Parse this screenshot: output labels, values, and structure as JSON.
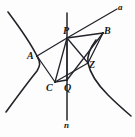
{
  "figure": {
    "stroke_color": "#22242a",
    "background_color": "#fdfdfd",
    "line_width_curve": 1.6,
    "line_width_segment": 1.3,
    "line_width_axis": 1.5
  },
  "labels": [
    {
      "id": "a",
      "text": "a",
      "x": 118,
      "y": 3,
      "size": "small"
    },
    {
      "id": "B",
      "text": "B",
      "x": 104,
      "y": 26,
      "size": "normal"
    },
    {
      "id": "P",
      "text": "P",
      "x": 63,
      "y": 26,
      "size": "normal"
    },
    {
      "id": "A",
      "text": "A",
      "x": 27,
      "y": 51,
      "size": "normal"
    },
    {
      "id": "Z",
      "text": "Z",
      "x": 89,
      "y": 60,
      "size": "normal"
    },
    {
      "id": "C",
      "text": "C",
      "x": 46,
      "y": 83,
      "size": "normal"
    },
    {
      "id": "Q",
      "text": "Q",
      "x": 64,
      "y": 83,
      "size": "normal"
    },
    {
      "id": "n",
      "text": "n",
      "x": 64,
      "y": 121,
      "size": "small"
    }
  ],
  "points": {
    "A": {
      "x": 37,
      "y": 56
    },
    "B": {
      "x": 103,
      "y": 33
    },
    "C": {
      "x": 55,
      "y": 82
    },
    "P": {
      "x": 67,
      "y": 38
    },
    "Q": {
      "x": 67,
      "y": 80
    },
    "Z": {
      "x": 88,
      "y": 63
    }
  },
  "curves": {
    "left_branch": "M 8,12 C 20,28 30,42 37,56 C 41,63 40,66 37,71 C 28,82 17,97 6,112",
    "right_branch": "M 96,40 C 90,48 87,56 88,63 C 90,73 98,85 108,95 C 116,103 124,110 131,116"
  },
  "lines": {
    "n_axis": {
      "x1": 67,
      "y1": 13,
      "x2": 67,
      "y2": 120
    },
    "a_ray": {
      "x1": 67,
      "y1": 38,
      "x2": 117,
      "y2": 9
    },
    "segments": [
      {
        "name": "A-P",
        "x1": 37,
        "y1": 56,
        "x2": 67,
        "y2": 38
      },
      {
        "name": "P-B",
        "x1": 67,
        "y1": 38,
        "x2": 103,
        "y2": 33
      },
      {
        "name": "A-C",
        "x1": 37,
        "y1": 56,
        "x2": 55,
        "y2": 82
      },
      {
        "name": "C-Q",
        "x1": 55,
        "y1": 82,
        "x2": 67,
        "y2": 80
      },
      {
        "name": "P-C",
        "x1": 67,
        "y1": 38,
        "x2": 55,
        "y2": 82
      },
      {
        "name": "P-Q",
        "x1": 67,
        "y1": 38,
        "x2": 67,
        "y2": 80
      },
      {
        "name": "P-Z",
        "x1": 67,
        "y1": 38,
        "x2": 88,
        "y2": 63
      },
      {
        "name": "B-Q",
        "x1": 103,
        "y1": 33,
        "x2": 67,
        "y2": 80
      },
      {
        "name": "B-Z",
        "x1": 103,
        "y1": 33,
        "x2": 88,
        "y2": 63
      },
      {
        "name": "Z-C",
        "x1": 88,
        "y1": 63,
        "x2": 55,
        "y2": 82
      }
    ]
  }
}
